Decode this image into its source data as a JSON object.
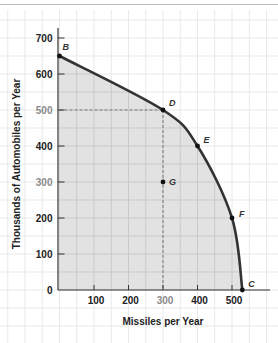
{
  "chart_data": {
    "type": "line",
    "title": "",
    "xlabel": "Missiles per Year",
    "ylabel": "Thousands of Automobiles per Year",
    "xlim": [
      0,
      600
    ],
    "ylim": [
      0,
      700
    ],
    "x_ticks": [
      100,
      200,
      300,
      400,
      500
    ],
    "y_ticks": [
      0,
      100,
      200,
      300,
      400,
      500,
      600,
      700
    ],
    "muted_x_ticks": [
      300
    ],
    "muted_y_ticks": [
      300,
      500
    ],
    "grid": true,
    "shaded_region": "area under the production possibilities frontier",
    "series": [
      {
        "name": "Production possibilities frontier",
        "x": [
          0,
          300,
          400,
          500,
          530
        ],
        "y": [
          650,
          500,
          400,
          200,
          0
        ]
      }
    ],
    "points": [
      {
        "label": "B",
        "x": 0,
        "y": 650,
        "label_dx": 3,
        "label_dy": -6
      },
      {
        "label": "D",
        "x": 300,
        "y": 500,
        "label_dx": 6,
        "label_dy": -4
      },
      {
        "label": "E",
        "x": 400,
        "y": 400,
        "label_dx": 6,
        "label_dy": -3
      },
      {
        "label": "F",
        "x": 500,
        "y": 200,
        "label_dx": 7,
        "label_dy": -1
      },
      {
        "label": "G",
        "x": 300,
        "y": 300,
        "label_dx": 6,
        "label_dy": 3
      },
      {
        "label": "C",
        "x": 530,
        "y": 0,
        "label_dx": 6,
        "label_dy": -3
      }
    ],
    "reference_lines": [
      {
        "from": [
          0,
          500
        ],
        "to": [
          300,
          500
        ],
        "style": "dashed"
      },
      {
        "from": [
          300,
          500
        ],
        "to": [
          300,
          0
        ],
        "style": "dashed"
      }
    ]
  },
  "colors": {
    "background": "#ffffff",
    "grid_outer": "#e9e9e9",
    "grid_inner": "#c9c9c9",
    "shade": "#e2e2e2",
    "curve": "#333333",
    "axis": "#333333",
    "dash": "#777777",
    "point": "#111111"
  },
  "layout": {
    "origin_x": 59.5,
    "origin_y": 290,
    "px_per_x": 0.345,
    "px_per_y": 0.36
  }
}
